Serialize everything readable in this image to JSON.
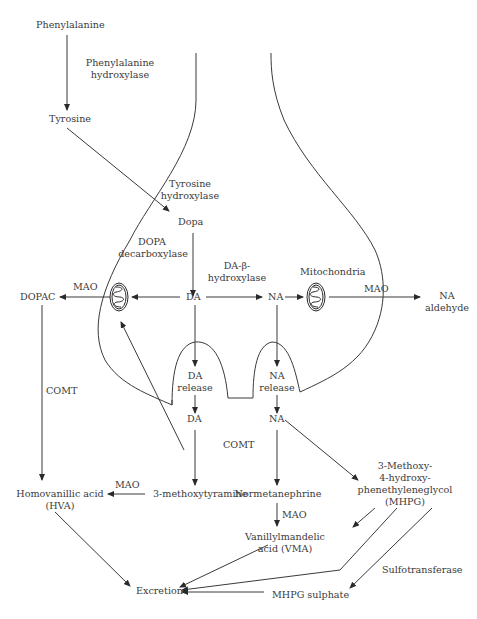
{
  "nodes": {
    "phenylalanine": "Phenylalanine",
    "tyrosine": "Tyrosine",
    "dopa": "Dopa",
    "da": "DA",
    "na": "NA",
    "dopac": "DOPAC",
    "na_aldehyde_1": "NA",
    "na_aldehyde_2": "aldehyde",
    "da_release_1": "DA",
    "da_release_2": "release",
    "na_release_1": "NA",
    "na_release_2": "release",
    "da_synaptic": "DA",
    "na_synaptic": "NA",
    "hva_1": "Homovanillic acid",
    "hva_2": "(HVA)",
    "methoxytyramine": "3-methoxytyramine",
    "normetanephrine": "Normetanephrine",
    "mhpg_1": "3-Methoxy-",
    "mhpg_2": "4-hydroxy-",
    "mhpg_3": "phenethyleneglycol",
    "mhpg_4": "(MHPG)",
    "vma_1": "Vanillylmandelic",
    "vma_2": "acid (VMA)",
    "excretion": "Excretion",
    "mhpg_sulphate": "MHPG sulphate",
    "mitochondria": "Mitochondria"
  },
  "enzymes": {
    "phenylalanine_hydroxylase_1": "Phenylalanine",
    "phenylalanine_hydroxylase_2": "hydroxylase",
    "tyrosine_hydroxylase_1": "Tyrosine",
    "tyrosine_hydroxylase_2": "hydroxylase",
    "dopa_decarboxylase_1": "DOPA",
    "dopa_decarboxylase_2": "decarboxylase",
    "dbh_1": "DA-β-",
    "dbh_2": "hydroxylase",
    "mao_left": "MAO",
    "mao_right": "MAO",
    "comt_left": "COMT",
    "comt_center": "COMT",
    "mao_hva": "MAO",
    "mao_vma": "MAO",
    "sulfotransferase": "Sulfotransferase"
  },
  "colors": {
    "line": "#3a3a3a",
    "text": "#3a3a3a",
    "background": "#ffffff"
  }
}
